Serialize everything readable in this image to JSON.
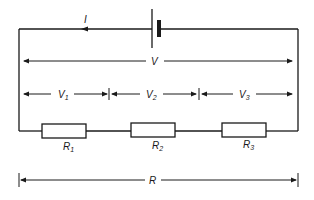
{
  "diagram": {
    "type": "series-circuit",
    "colors": {
      "line": "#1a1a1a",
      "background": "#ffffff"
    },
    "battery": {
      "label": ""
    },
    "current": {
      "label": "I",
      "direction": "left"
    },
    "total_voltage": {
      "label": "V"
    },
    "voltages": [
      {
        "label": "V",
        "sub": "1"
      },
      {
        "label": "V",
        "sub": "2"
      },
      {
        "label": "V",
        "sub": "3"
      }
    ],
    "resistors": [
      {
        "label": "R",
        "sub": "1"
      },
      {
        "label": "R",
        "sub": "2"
      },
      {
        "label": "R",
        "sub": "3"
      }
    ],
    "total_resistance": {
      "label": "R"
    }
  }
}
